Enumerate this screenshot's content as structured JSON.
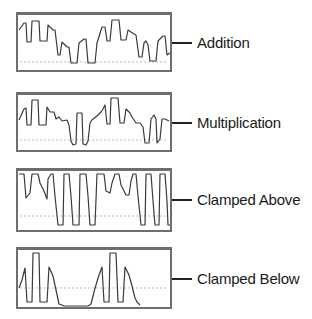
{
  "panels": [
    {
      "label": "Addition",
      "top": 12,
      "height": 60,
      "label_y": 34,
      "baseline": 47,
      "points": "1,15 6,8 8,8 9,27 13,27 14,6 21,6 22,26 29,26 30,10 35,15 37,15 40,40 42,40 44,27 49,32 51,32 53,48 59,48 61,28 66,24 68,24 70,48 77,48 79,28 84,12 87,12 89,26 92,26 94,5 101,5 103,25 108,25 110,15 116,19 118,20 121,42 124,42 126,28 128,26 130,30 132,46 138,46 140,26 145,21 147,21 149,40 152,38"
    },
    {
      "label": "Multiplication",
      "top": 92,
      "height": 60,
      "label_y": 114,
      "baseline": 45,
      "points": "1,25 6,14 8,13 9,30 13,30 14,5 20,5 21,30 28,30 29,12 32,17 36,17 38,24 41,22 44,26 49,25 51,30 53,46 55,50 58,49 59,18 64,18 65,49 68,50 70,46 72,28 74,25 80,20 83,17 85,14 87,10 89,29 92,29 93,3 100,3 102,28 106,28 108,14 112,18 114,22 118,28 122,28 125,32 127,48 131,48 133,24 136,20 138,24 139,48 142,44 144,24 147,24 151,26"
    },
    {
      "label": "Clamped Above",
      "top": 168,
      "height": 64,
      "label_y": 191,
      "baseline": 45,
      "points": "1,3 6,3 8,27 12,22 14,3 20,3 22,12 26,20 29,28 30,8 33,3 35,3 37,25 40,54 45,54 46,3 51,3 53,25 55,54 61,54 62,3 68,3 70,25 72,54 77,54 79,3 86,3 88,20 92,22 94,12 97,3 101,3 103,14 108,24 111,24 113,10 115,3 118,3 120,25 123,54 127,54 128,3 133,3 135,30 137,54 141,54 142,3 147,3 149,30 150,54 152,54"
    },
    {
      "label": "Clamped Below",
      "top": 247,
      "height": 62,
      "label_y": 270,
      "baseline": 38,
      "points": "1,38 4,30 7,18 9,52 14,52 15,3 21,3 22,52 29,52 31,17 35,26 38,40 41,54 44,55 46,56 70,56 73,54 76,42 80,28 84,17 86,52 91,52 92,3 98,3 100,52 105,52 107,17 111,25 114,36 117,48 119,52 122,55"
    }
  ],
  "colors": {
    "wave": "#3a3a3a",
    "border": "#6e6e6e",
    "baseline": "#bdbdbd",
    "text": "#1a1a1a"
  }
}
